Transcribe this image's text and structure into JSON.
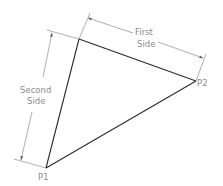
{
  "diagram": {
    "type": "triangle-dimension-drawing",
    "colors": {
      "background": "#ffffff",
      "triangle_stroke": "#2a2a2a",
      "dimension_stroke": "#8c8c8c",
      "label_text": "#8c8c8c"
    },
    "vertices": {
      "p1": {
        "label": "P1",
        "x": 46,
        "y": 168
      },
      "p2": {
        "label": "P2",
        "x": 196,
        "y": 81
      },
      "top": {
        "x": 79,
        "y": 39
      }
    },
    "dimensions": {
      "first_side": {
        "line1": "First",
        "line2": "Side"
      },
      "second_side": {
        "line1": "Second",
        "line2": "Side"
      }
    }
  }
}
